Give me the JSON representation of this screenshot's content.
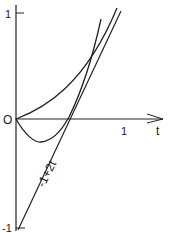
{
  "diagram": {
    "axes": {
      "y_tick_top": "1",
      "origin": "O",
      "y_tick_bottom": "-1",
      "x_tick": "1",
      "x_axis_label": "t"
    },
    "line_label": "-1+2t",
    "colors": {
      "ink": "#222222",
      "background": "#ffffff"
    }
  }
}
